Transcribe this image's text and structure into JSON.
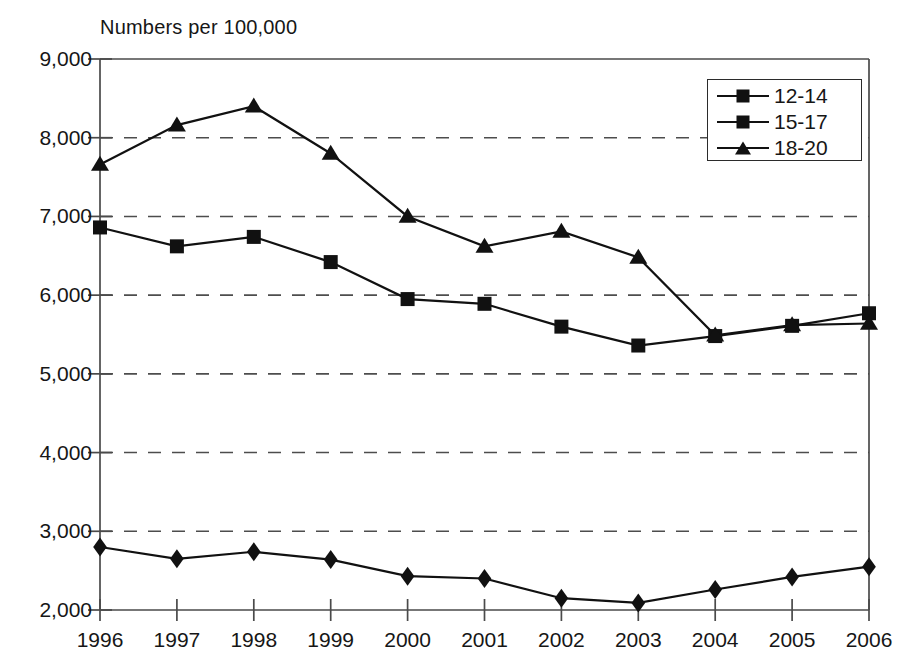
{
  "chart_data": {
    "type": "line",
    "title": "",
    "ylabel": "Numbers per 100,000",
    "xlabel": "",
    "categories": [
      "1996",
      "1997",
      "1998",
      "1999",
      "2000",
      "2001",
      "2002",
      "2003",
      "2004",
      "2005",
      "2006"
    ],
    "x": [
      1996,
      1997,
      1998,
      1999,
      2000,
      2001,
      2002,
      2003,
      2004,
      2005,
      2006
    ],
    "ylim": [
      2000,
      9000
    ],
    "ytick_labels": [
      "9,000",
      "8,000",
      "7,000",
      "6,000",
      "5,000",
      "4,000",
      "3,000",
      "2,000"
    ],
    "yticks": [
      9000,
      8000,
      7000,
      6000,
      5000,
      4000,
      3000,
      2000
    ],
    "grid": "horizontal-dashed",
    "legend_position": "top-right",
    "series": [
      {
        "name": "12-14",
        "marker": "diamond",
        "values": [
          2800,
          2650,
          2740,
          2640,
          2430,
          2400,
          2150,
          2090,
          2260,
          2420,
          2550
        ]
      },
      {
        "name": "15-17",
        "marker": "square",
        "values": [
          6860,
          6620,
          6740,
          6420,
          5950,
          5890,
          5600,
          5360,
          5480,
          5610,
          5770
        ]
      },
      {
        "name": "18-20",
        "marker": "triangle",
        "values": [
          7660,
          8160,
          8400,
          7800,
          7000,
          6620,
          6810,
          6480,
          5490,
          5620,
          5640
        ]
      }
    ]
  },
  "legend": {
    "items": [
      {
        "label": "12-14",
        "marker": "diamond"
      },
      {
        "label": "15-17",
        "marker": "square"
      },
      {
        "label": "18-20",
        "marker": "triangle"
      }
    ]
  },
  "axes": {
    "y_axis_title": "Numbers per 100,000"
  }
}
